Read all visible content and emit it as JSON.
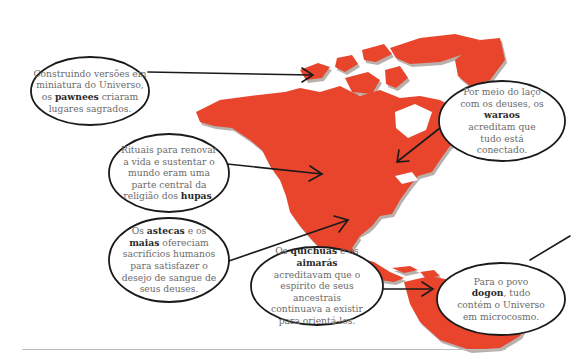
{
  "colors": {
    "map_fill": "#e8452c",
    "map_shadow": "#b9b0ac",
    "bubble_stroke": "#1a1a1a",
    "text": "#6b6b6b",
    "bold_text": "#2a2a2a",
    "rule": "#bdbdbd"
  },
  "bubbles": [
    {
      "id": "pawnees",
      "pre": "Construindo versões em miniatura do Universo, os ",
      "bold": "pawnees",
      "post": " criaram lugares sagrados."
    },
    {
      "id": "waraos",
      "pre": "Por meio do laço com os deuses, os ",
      "bold": "waraos",
      "post": " acreditam que tudo está conectado."
    },
    {
      "id": "hupas",
      "pre": "Rituais para renovar a vida e sustentar o mundo eram uma parte central da religião dos ",
      "bold": "hupas",
      "post": "."
    },
    {
      "id": "astecas_maias",
      "pre": "Os ",
      "bold": "astecas",
      "mid": " e os ",
      "bold2": "maias",
      "post": " ofereciam sacrifícios humanos para satisfazer o desejo de sangue de seus deuses."
    },
    {
      "id": "quichuas_aimaras",
      "pre": "Os ",
      "bold": "quíchuas",
      "mid": " e os ",
      "bold2": "aimarás",
      "post": " acreditavam que o espírito de seus ancestrais continuava a existir para orientá-los."
    },
    {
      "id": "dogon",
      "pre": "Para o povo ",
      "bold": "dogon",
      "post": ", tudo contém o Universo em microcosmo."
    }
  ]
}
